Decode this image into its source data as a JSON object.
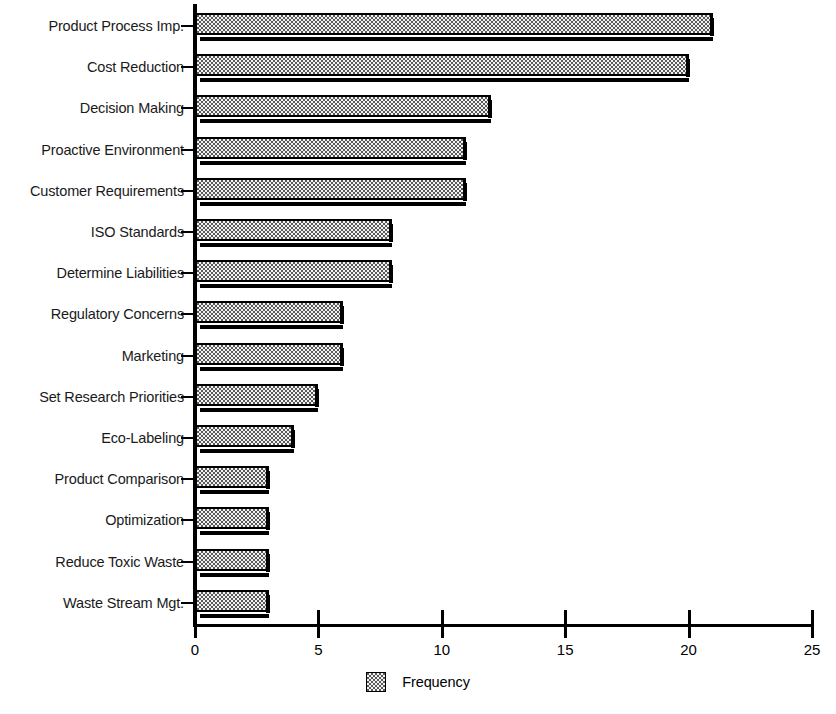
{
  "chart_data": {
    "type": "bar",
    "orientation": "horizontal",
    "title": "",
    "xlabel": "",
    "ylabel": "",
    "xlim": [
      0,
      25
    ],
    "xticks": [
      0,
      5,
      10,
      15,
      20,
      25
    ],
    "grid": false,
    "legend": {
      "position": "bottom-center",
      "entries": [
        {
          "label": "Frequency",
          "swatch": "dotted-pattern-swatch"
        }
      ]
    },
    "series_name": "Frequency",
    "categories": [
      "Product Process Imp.",
      "Cost Reduction",
      "Decision Making",
      "Proactive Environment",
      "Customer Requirements",
      "ISO Standards",
      "Determine Liabilities",
      "Regulatory Concerns",
      "Marketing",
      "Set Research Priorities",
      "Eco-Labeling",
      "Product Comparison",
      "Optimization",
      "Reduce Toxic Waste",
      "Waste Stream Mgt."
    ],
    "values": [
      21,
      20,
      12,
      11,
      11,
      8,
      8,
      6,
      6,
      5,
      4,
      3,
      3,
      3,
      3
    ]
  },
  "style": {
    "bar_fill": "#f2f2f2",
    "bar_outline": "#000000",
    "bar_shadow": "#000000",
    "axis_color": "#000000",
    "text_color": "#000000",
    "background": "#ffffff"
  }
}
